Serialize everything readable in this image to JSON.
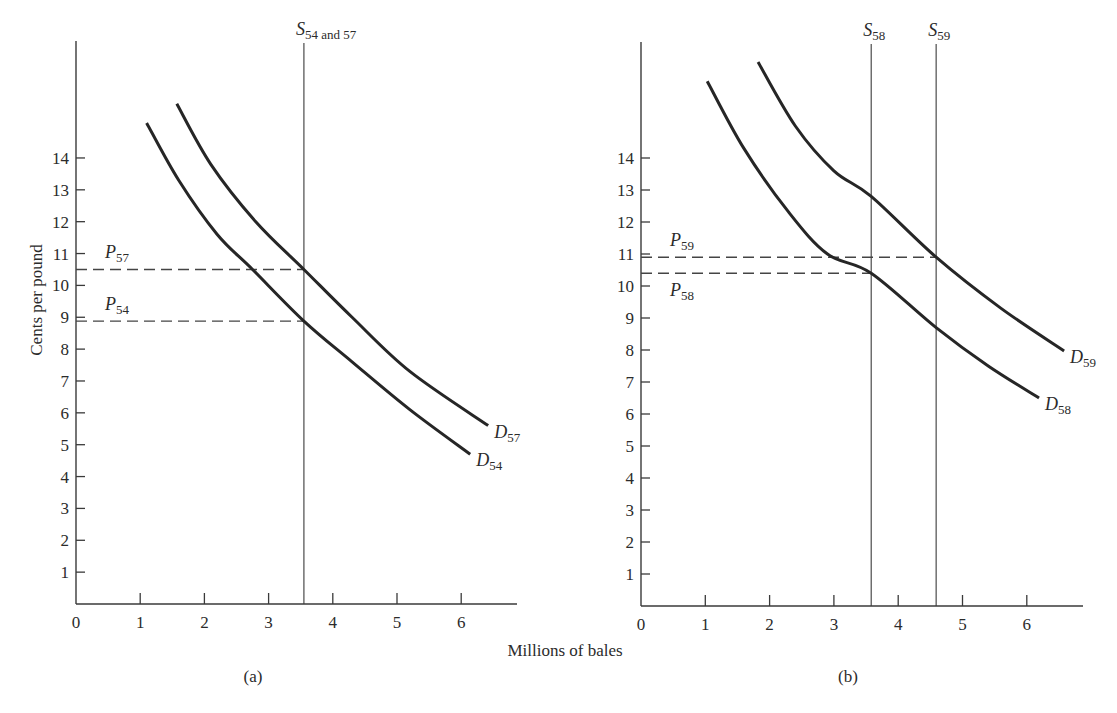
{
  "figure": {
    "x_axis_label": "Millions of bales",
    "y_axis_label": "Cents per pound"
  },
  "chart_data": [
    {
      "type": "line",
      "panel": "a",
      "caption": "(a)",
      "title": "",
      "xlabel": "Millions of bales",
      "ylabel": "Cents per pound",
      "xlim": [
        0,
        6.8
      ],
      "ylim": [
        0,
        17.5
      ],
      "x_ticks": [
        0,
        1,
        2,
        3,
        4,
        5,
        6
      ],
      "y_ticks": [
        1,
        2,
        3,
        4,
        5,
        6,
        7,
        8,
        9,
        10,
        11,
        12,
        13,
        14
      ],
      "grid": false,
      "supply_lines": [
        {
          "name": "S",
          "subscript": "54 and 57",
          "x": 3.55
        }
      ],
      "series": [
        {
          "name": "D",
          "subscript": "54",
          "points": [
            [
              1.1,
              15.1
            ],
            [
              1.6,
              13.3
            ],
            [
              2.2,
              11.6
            ],
            [
              2.75,
              10.5
            ],
            [
              3.55,
              8.88
            ],
            [
              4.3,
              7.6
            ],
            [
              5.2,
              6.1
            ],
            [
              6.14,
              4.7
            ]
          ]
        },
        {
          "name": "D",
          "subscript": "57",
          "points": [
            [
              1.57,
              15.7
            ],
            [
              2.1,
              13.8
            ],
            [
              2.8,
              12.0
            ],
            [
              3.55,
              10.5
            ],
            [
              4.3,
              9.0
            ],
            [
              5.2,
              7.3
            ],
            [
              6.42,
              5.6
            ]
          ]
        }
      ],
      "price_lines": [
        {
          "name": "P",
          "subscript": "57",
          "y": 10.5,
          "x_end": 3.55,
          "label_pos": "above"
        },
        {
          "name": "P",
          "subscript": "54",
          "y": 8.88,
          "x_end": 3.55,
          "label_pos": "above"
        }
      ]
    },
    {
      "type": "line",
      "panel": "b",
      "caption": "(b)",
      "title": "",
      "xlabel": "Millions of bales",
      "ylabel": "",
      "xlim": [
        0,
        6.8
      ],
      "ylim": [
        0,
        17.5
      ],
      "x_ticks": [
        0,
        1,
        2,
        3,
        4,
        5,
        6
      ],
      "y_ticks": [
        1,
        2,
        3,
        4,
        5,
        6,
        7,
        8,
        9,
        10,
        11,
        12,
        13,
        14
      ],
      "grid": false,
      "supply_lines": [
        {
          "name": "S",
          "subscript": "58",
          "x": 3.58
        },
        {
          "name": "S",
          "subscript": "59",
          "x": 4.59
        }
      ],
      "series": [
        {
          "name": "D",
          "subscript": "58",
          "points": [
            [
              1.03,
              16.4
            ],
            [
              1.6,
              14.3
            ],
            [
              2.3,
              12.3
            ],
            [
              2.9,
              11.0
            ],
            [
              3.58,
              10.4
            ],
            [
              4.59,
              8.7
            ],
            [
              5.4,
              7.5
            ],
            [
              6.19,
              6.5
            ]
          ]
        },
        {
          "name": "D",
          "subscript": "59",
          "points": [
            [
              1.82,
              17.0
            ],
            [
              2.4,
              15.0
            ],
            [
              3.0,
              13.6
            ],
            [
              3.58,
              12.8
            ],
            [
              4.59,
              10.9
            ],
            [
              5.6,
              9.3
            ],
            [
              6.58,
              7.97
            ]
          ]
        }
      ],
      "price_lines": [
        {
          "name": "P",
          "subscript": "59",
          "y": 10.9,
          "x_end": 4.59,
          "label_pos": "above"
        },
        {
          "name": "P",
          "subscript": "58",
          "y": 10.4,
          "x_end": 3.58,
          "label_pos": "below"
        }
      ]
    }
  ]
}
